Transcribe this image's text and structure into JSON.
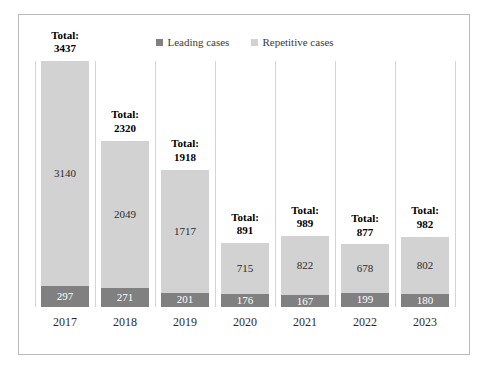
{
  "chart_data": {
    "type": "bar",
    "subtype": "stacked-bar",
    "title": "",
    "xlabel": "",
    "ylabel": "",
    "grid": "vertical-category-separators",
    "legend_position": "top-center",
    "ylim": [
      0,
      3437
    ],
    "categories": [
      "2017",
      "2018",
      "2019",
      "2020",
      "2021",
      "2022",
      "2023"
    ],
    "series": [
      {
        "name": "Leading cases",
        "color": "#808080",
        "values": [
          297,
          271,
          201,
          176,
          167,
          199,
          180
        ]
      },
      {
        "name": "Repetitive cases",
        "color": "#d2d2d2",
        "values": [
          3140,
          2049,
          1717,
          715,
          822,
          678,
          802
        ]
      }
    ],
    "totals": [
      3437,
      2320,
      1918,
      891,
      989,
      877,
      982
    ],
    "total_label_prefix": "Total:"
  },
  "legend": {
    "items": [
      {
        "label": "Leading cases",
        "color": "#808080"
      },
      {
        "label": "Repetitive cases",
        "color": "#d2d2d2"
      }
    ]
  },
  "bars": [
    {
      "year": "2017",
      "total_label": "Total:",
      "total": "3437",
      "repetitive": "3140",
      "leading": "297"
    },
    {
      "year": "2018",
      "total_label": "Total:",
      "total": "2320",
      "repetitive": "2049",
      "leading": "271"
    },
    {
      "year": "2019",
      "total_label": "Total:",
      "total": "1918",
      "repetitive": "1717",
      "leading": "201"
    },
    {
      "year": "2020",
      "total_label": "Total:",
      "total": "891",
      "repetitive": "715",
      "leading": "176"
    },
    {
      "year": "2021",
      "total_label": "Total:",
      "total": "989",
      "repetitive": "822",
      "leading": "167"
    },
    {
      "year": "2022",
      "total_label": "Total:",
      "total": "877",
      "repetitive": "678",
      "leading": "199"
    },
    {
      "year": "2023",
      "total_label": "Total:",
      "total": "982",
      "repetitive": "802",
      "leading": "180"
    }
  ],
  "axis": {
    "x_ticks": [
      "2017",
      "2018",
      "2019",
      "2020",
      "2021",
      "2022",
      "2023"
    ]
  },
  "colors": {
    "leading": "#808080",
    "repetitive": "#d2d2d2",
    "frame": "#b9b9b9",
    "gridline": "#d4d4d4",
    "background": "#ffffff"
  }
}
